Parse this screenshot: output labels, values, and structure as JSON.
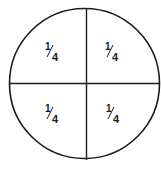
{
  "diagram": {
    "type": "fraction-circle",
    "divisions": 4,
    "stroke_color": "#1a1a1a",
    "quadrants": [
      {
        "position": "top-left",
        "numerator": "1",
        "denominator": "4"
      },
      {
        "position": "top-right",
        "numerator": "1",
        "denominator": "4"
      },
      {
        "position": "bottom-left",
        "numerator": "1",
        "denominator": "4"
      },
      {
        "position": "bottom-right",
        "numerator": "1",
        "denominator": "4"
      }
    ]
  }
}
